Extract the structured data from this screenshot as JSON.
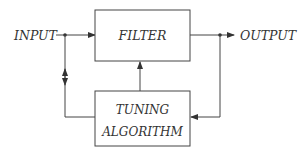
{
  "diagram": {
    "type": "block-diagram",
    "colors": {
      "stroke": "#444444",
      "text": "#333333",
      "background": "#ffffff"
    },
    "input_label": "INPUT",
    "output_label": "OUTPUT",
    "blocks": {
      "filter": {
        "label": "FILTER"
      },
      "tuning": {
        "line1": "TUNING",
        "line2": "ALGORITHM"
      }
    },
    "connections": [
      {
        "from": "INPUT",
        "to": "FILTER",
        "type": "arrow"
      },
      {
        "from": "FILTER",
        "to": "OUTPUT",
        "type": "arrow"
      },
      {
        "from": "INPUT",
        "to": "TUNING ALGORITHM",
        "type": "bidirectional"
      },
      {
        "from": "OUTPUT",
        "to": "TUNING ALGORITHM",
        "type": "arrow"
      },
      {
        "from": "TUNING ALGORITHM",
        "to": "FILTER",
        "type": "arrow"
      }
    ]
  }
}
